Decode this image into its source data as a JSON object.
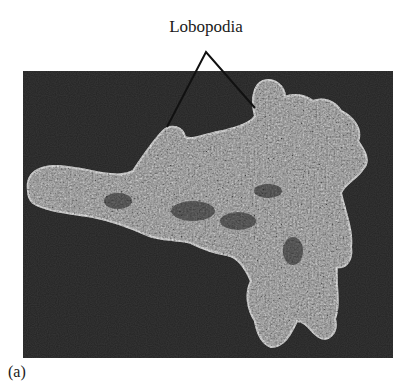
{
  "figure": {
    "callout_label": "Lobopodia",
    "panel_label": "(a)",
    "image_subject": "amoeba-micrograph",
    "colors": {
      "background": "#232323",
      "cell": "#9a9a9a",
      "text": "#1a1a1a"
    }
  }
}
